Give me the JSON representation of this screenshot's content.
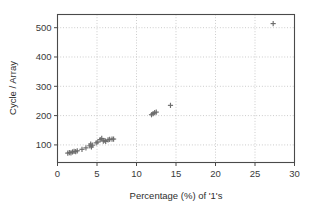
{
  "chart_data": {
    "type": "scatter",
    "title": "",
    "xlabel": "Percentage (%) of '1's",
    "ylabel": "Cycle / Array",
    "xlim": [
      0,
      30
    ],
    "ylim": [
      40,
      545
    ],
    "xticks": [
      0,
      5,
      10,
      15,
      20,
      25,
      30
    ],
    "xtick_labels": [
      "0",
      "5",
      "10",
      "15",
      "20",
      "25",
      "30"
    ],
    "yticks": [
      100,
      200,
      300,
      400,
      500
    ],
    "ytick_labels": [
      "100",
      "200",
      "300",
      "400",
      "500"
    ],
    "grid": true,
    "legend": null,
    "marker": "plus",
    "marker_color": "#6d6d6d",
    "series": [
      {
        "name": "Cycle / Array vs Percentage of 1's",
        "points": [
          [
            1.3,
            72
          ],
          [
            1.5,
            74
          ],
          [
            1.7,
            73
          ],
          [
            1.9,
            76
          ],
          [
            2.1,
            78
          ],
          [
            2.3,
            77
          ],
          [
            2.5,
            80
          ],
          [
            3.1,
            85
          ],
          [
            3.6,
            90
          ],
          [
            4.1,
            97
          ],
          [
            4.2,
            103
          ],
          [
            4.3,
            93
          ],
          [
            4.4,
            99
          ],
          [
            4.9,
            107
          ],
          [
            5.1,
            110
          ],
          [
            5.4,
            118
          ],
          [
            5.6,
            122
          ],
          [
            5.8,
            113
          ],
          [
            6.0,
            115
          ],
          [
            6.1,
            112
          ],
          [
            6.4,
            117
          ],
          [
            6.6,
            119
          ],
          [
            6.9,
            120
          ],
          [
            7.1,
            120
          ],
          [
            11.9,
            203
          ],
          [
            12.1,
            207
          ],
          [
            12.3,
            210
          ],
          [
            12.5,
            212
          ],
          [
            14.3,
            235
          ],
          [
            27.3,
            514
          ]
        ]
      }
    ]
  },
  "axes": {
    "x_axis_title": "Percentage (%) of '1's",
    "y_axis_title": "Cycle / Array"
  }
}
